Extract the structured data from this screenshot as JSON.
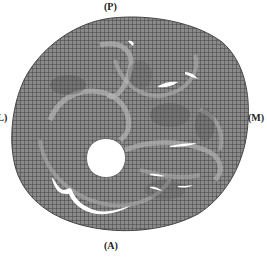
{
  "figure": {
    "type": "finite-element mesh cross-section",
    "mesh_color": "#6e6e6e",
    "mesh_line_color": "#3a3a3a",
    "background_color": "#ffffff",
    "labels": {
      "top": "(P)",
      "left": "(L)",
      "right": "(M)",
      "bottom": "(A)"
    }
  }
}
